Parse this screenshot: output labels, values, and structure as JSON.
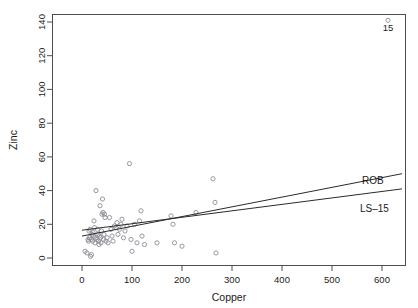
{
  "chart_data": {
    "type": "scatter",
    "title": "",
    "xlabel": "Copper",
    "ylabel": "Zinc",
    "xlim": [
      -20,
      660
    ],
    "ylim": [
      -8,
      146
    ],
    "xticks": [
      0,
      100,
      200,
      300,
      400,
      500,
      600
    ],
    "yticks": [
      0,
      20,
      40,
      60,
      80,
      100,
      120,
      140
    ],
    "grid": false,
    "legend_position": "right-inline",
    "point_marker": "open-circle",
    "points": [
      {
        "x": 6,
        "y": 4
      },
      {
        "x": 10,
        "y": 3
      },
      {
        "x": 12,
        "y": 11
      },
      {
        "x": 13,
        "y": 10
      },
      {
        "x": 14,
        "y": 16
      },
      {
        "x": 15,
        "y": 12
      },
      {
        "x": 16,
        "y": 17
      },
      {
        "x": 17,
        "y": 1
      },
      {
        "x": 18,
        "y": 11
      },
      {
        "x": 19,
        "y": 2
      },
      {
        "x": 20,
        "y": 14
      },
      {
        "x": 21,
        "y": 10
      },
      {
        "x": 22,
        "y": 15
      },
      {
        "x": 23,
        "y": 13
      },
      {
        "x": 24,
        "y": 22
      },
      {
        "x": 25,
        "y": 18
      },
      {
        "x": 26,
        "y": 9
      },
      {
        "x": 27,
        "y": 12
      },
      {
        "x": 28,
        "y": 40
      },
      {
        "x": 30,
        "y": 11
      },
      {
        "x": 31,
        "y": 17
      },
      {
        "x": 32,
        "y": 14
      },
      {
        "x": 33,
        "y": 10
      },
      {
        "x": 34,
        "y": 8
      },
      {
        "x": 35,
        "y": 13
      },
      {
        "x": 36,
        "y": 31
      },
      {
        "x": 37,
        "y": 12
      },
      {
        "x": 38,
        "y": 9
      },
      {
        "x": 39,
        "y": 16
      },
      {
        "x": 40,
        "y": 26
      },
      {
        "x": 41,
        "y": 35
      },
      {
        "x": 42,
        "y": 27
      },
      {
        "x": 43,
        "y": 11
      },
      {
        "x": 44,
        "y": 14
      },
      {
        "x": 45,
        "y": 26
      },
      {
        "x": 46,
        "y": 24
      },
      {
        "x": 48,
        "y": 10
      },
      {
        "x": 50,
        "y": 12
      },
      {
        "x": 52,
        "y": 9
      },
      {
        "x": 55,
        "y": 24
      },
      {
        "x": 58,
        "y": 17
      },
      {
        "x": 60,
        "y": 13
      },
      {
        "x": 62,
        "y": 10
      },
      {
        "x": 65,
        "y": 19
      },
      {
        "x": 68,
        "y": 18
      },
      {
        "x": 70,
        "y": 21
      },
      {
        "x": 72,
        "y": 14
      },
      {
        "x": 75,
        "y": 17
      },
      {
        "x": 78,
        "y": 20
      },
      {
        "x": 80,
        "y": 23
      },
      {
        "x": 83,
        "y": 12
      },
      {
        "x": 86,
        "y": 16
      },
      {
        "x": 90,
        "y": 19
      },
      {
        "x": 95,
        "y": 56
      },
      {
        "x": 98,
        "y": 11
      },
      {
        "x": 100,
        "y": 4
      },
      {
        "x": 105,
        "y": 20
      },
      {
        "x": 110,
        "y": 9
      },
      {
        "x": 115,
        "y": 22
      },
      {
        "x": 118,
        "y": 28
      },
      {
        "x": 120,
        "y": 13
      },
      {
        "x": 125,
        "y": 8
      },
      {
        "x": 150,
        "y": 9
      },
      {
        "x": 178,
        "y": 25
      },
      {
        "x": 182,
        "y": 20
      },
      {
        "x": 185,
        "y": 9
      },
      {
        "x": 200,
        "y": 7
      },
      {
        "x": 228,
        "y": 27
      },
      {
        "x": 262,
        "y": 47
      },
      {
        "x": 266,
        "y": 33
      },
      {
        "x": 268,
        "y": 3
      },
      {
        "x": 612,
        "y": 141
      }
    ],
    "labeled_points": [
      {
        "x": 612,
        "y": 141,
        "label": "15"
      }
    ],
    "series": [
      {
        "name": "ROB",
        "type": "line",
        "x": [
          0,
          640
        ],
        "values": [
          13.0,
          50.0
        ]
      },
      {
        "name": "LS-15",
        "type": "line",
        "x": [
          0,
          640
        ],
        "values": [
          16.5,
          41.0
        ]
      }
    ],
    "legend_entries": [
      {
        "label": "ROB"
      },
      {
        "label": "LS–15"
      }
    ]
  },
  "axes": {
    "x_title": "Copper",
    "y_title": "Zinc",
    "x_tick_labels": [
      "0",
      "100",
      "200",
      "300",
      "400",
      "500",
      "600"
    ],
    "y_tick_labels": [
      "0",
      "20",
      "40",
      "60",
      "80",
      "100",
      "120",
      "140"
    ]
  },
  "annotations": {
    "outlier_label": "15",
    "rob_label": "ROB",
    "ls_label": "LS–15"
  },
  "colors": {
    "background": "#ffffff",
    "frame": "#4d4d4d",
    "point": "#8c8c96",
    "line": "#2b2b2b",
    "text": "#1a1a1a"
  }
}
